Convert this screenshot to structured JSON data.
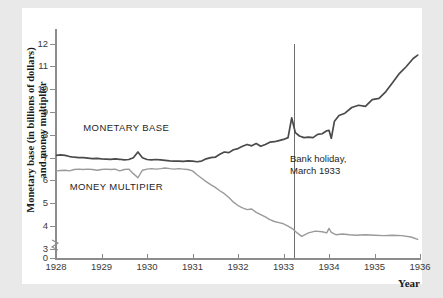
{
  "chart_data": {
    "type": "line",
    "title": "",
    "xlabel": "Year",
    "ylabel": "Monetary base (in billions of dollars)\nand money multiplier",
    "xlim": [
      1928,
      1936
    ],
    "ylim": [
      2.6,
      12.6
    ],
    "y_axis_break": true,
    "y_tick_labels": [
      "12",
      "11",
      "10",
      "9",
      "8",
      "7",
      "6",
      "5",
      "4",
      "3",
      "0"
    ],
    "y_tick_values": [
      12,
      11,
      10,
      9,
      8,
      7,
      6,
      5,
      4,
      3,
      0
    ],
    "x_tick_labels": [
      "1928",
      "1929",
      "1930",
      "1931",
      "1932",
      "1933",
      "1934",
      "1935",
      "1936"
    ],
    "x_tick_values": [
      1928,
      1929,
      1930,
      1931,
      1932,
      1933,
      1934,
      1935,
      1936
    ],
    "grid": false,
    "legend": "inline-labels",
    "annotations": [
      {
        "text": "Bank holiday,\nMarch 1933",
        "x": 1933.22,
        "line": true
      }
    ],
    "series": [
      {
        "name": "MONETARY BASE",
        "color": "#4a4a4a",
        "label_x": 1928.6,
        "label_y": 8.3,
        "x": [
          1928.0,
          1928.1,
          1928.2,
          1928.3,
          1928.4,
          1928.5,
          1928.6,
          1928.7,
          1928.8,
          1928.9,
          1929.0,
          1929.1,
          1929.2,
          1929.3,
          1929.4,
          1929.5,
          1929.6,
          1929.7,
          1929.8,
          1929.9,
          1930.0,
          1930.1,
          1930.2,
          1930.3,
          1930.4,
          1930.5,
          1930.6,
          1930.7,
          1930.8,
          1930.9,
          1931.0,
          1931.1,
          1931.2,
          1931.3,
          1931.4,
          1931.5,
          1931.6,
          1931.7,
          1931.8,
          1931.9,
          1932.0,
          1932.1,
          1932.2,
          1932.3,
          1932.4,
          1932.5,
          1932.6,
          1932.7,
          1932.8,
          1932.9,
          1933.0,
          1933.1,
          1933.18,
          1933.26,
          1933.35,
          1933.45,
          1933.55,
          1933.65,
          1933.75,
          1933.85,
          1933.95,
          1934.0,
          1934.05,
          1934.12,
          1934.22,
          1934.35,
          1934.5,
          1934.65,
          1934.8,
          1934.95,
          1935.1,
          1935.25,
          1935.4,
          1935.55,
          1935.7,
          1935.85,
          1935.95
        ],
        "y": [
          7.1,
          7.12,
          7.1,
          7.05,
          7.02,
          7.0,
          7.0,
          6.98,
          6.96,
          6.97,
          6.95,
          6.94,
          6.93,
          6.95,
          6.93,
          6.9,
          6.92,
          7.0,
          7.25,
          7.0,
          6.92,
          6.9,
          6.92,
          6.9,
          6.88,
          6.86,
          6.85,
          6.85,
          6.84,
          6.86,
          6.85,
          6.82,
          6.85,
          6.95,
          7.0,
          7.02,
          7.15,
          7.25,
          7.22,
          7.35,
          7.4,
          7.5,
          7.58,
          7.52,
          7.62,
          7.5,
          7.58,
          7.68,
          7.7,
          7.75,
          7.8,
          7.88,
          8.75,
          8.1,
          7.95,
          7.88,
          7.9,
          7.88,
          8.02,
          8.05,
          8.18,
          8.2,
          7.85,
          8.6,
          8.85,
          8.95,
          9.2,
          9.3,
          9.25,
          9.55,
          9.6,
          9.9,
          10.3,
          10.7,
          11.0,
          11.35,
          11.5
        ]
      },
      {
        "name": "MONEY MULTIPIER",
        "color": "#9a9a9a",
        "label_x": 1928.3,
        "label_y": 5.7,
        "x": [
          1928.0,
          1928.1,
          1928.2,
          1928.3,
          1928.4,
          1928.5,
          1928.6,
          1928.7,
          1928.8,
          1928.9,
          1929.0,
          1929.1,
          1929.2,
          1929.3,
          1929.4,
          1929.5,
          1929.6,
          1929.7,
          1929.8,
          1929.9,
          1930.0,
          1930.1,
          1930.2,
          1930.3,
          1930.4,
          1930.5,
          1930.6,
          1930.7,
          1930.8,
          1930.9,
          1931.0,
          1931.1,
          1931.2,
          1931.3,
          1931.4,
          1931.5,
          1931.6,
          1931.7,
          1931.8,
          1931.9,
          1932.0,
          1932.1,
          1932.2,
          1932.3,
          1932.4,
          1932.5,
          1932.6,
          1932.7,
          1932.8,
          1932.9,
          1933.0,
          1933.1,
          1933.2,
          1933.3,
          1933.4,
          1933.55,
          1933.7,
          1933.85,
          1933.95,
          1934.0,
          1934.05,
          1934.15,
          1934.3,
          1934.45,
          1934.6,
          1934.8,
          1935.0,
          1935.2,
          1935.4,
          1935.6,
          1935.8,
          1935.95
        ],
        "y": [
          6.42,
          6.44,
          6.45,
          6.42,
          6.48,
          6.5,
          6.48,
          6.5,
          6.48,
          6.45,
          6.48,
          6.5,
          6.48,
          6.5,
          6.42,
          6.48,
          6.5,
          6.3,
          6.12,
          6.45,
          6.5,
          6.52,
          6.5,
          6.52,
          6.55,
          6.52,
          6.5,
          6.52,
          6.5,
          6.48,
          6.42,
          6.25,
          6.1,
          5.95,
          5.82,
          5.7,
          5.55,
          5.42,
          5.25,
          5.05,
          4.9,
          4.8,
          4.72,
          4.75,
          4.6,
          4.5,
          4.4,
          4.28,
          4.2,
          4.15,
          4.1,
          4.0,
          3.88,
          3.7,
          3.55,
          3.7,
          3.78,
          3.75,
          3.7,
          3.9,
          3.72,
          3.62,
          3.65,
          3.62,
          3.6,
          3.62,
          3.6,
          3.58,
          3.6,
          3.58,
          3.52,
          3.42
        ]
      }
    ]
  }
}
